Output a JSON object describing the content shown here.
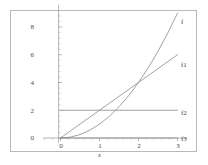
{
  "chart_data": {
    "type": "line",
    "title": "",
    "subtitle": "",
    "xlabel": "x",
    "ylabel": "",
    "xlim": [
      -0.45,
      3.25
    ],
    "ylim": [
      -0.35,
      9.6
    ],
    "grid": false,
    "legend_position": "right-inline-end-of-curve",
    "x_ticks": [
      "0",
      "1",
      "2",
      "3"
    ],
    "x_tick_values": [
      0,
      1,
      2,
      3
    ],
    "y_ticks": [
      "0",
      "2",
      "4",
      "6",
      "8"
    ],
    "y_tick_values": [
      0,
      2,
      4,
      6,
      8
    ],
    "series": [
      {
        "name": "f",
        "label": "f",
        "color": "#8a8a8a",
        "description": "quadratic curve rising steeply, y = x squared",
        "x": [
          0,
          0.25,
          0.5,
          0.75,
          1,
          1.25,
          1.5,
          1.75,
          2,
          2.25,
          2.5,
          2.75,
          3
        ],
        "values": [
          0,
          0.06,
          0.25,
          0.56,
          1,
          1.56,
          2.25,
          3.06,
          4,
          5.06,
          6.25,
          7.56,
          9
        ]
      },
      {
        "name": "f1",
        "label": "f1",
        "color": "#8a8a8a",
        "description": "straight line through the origin, y = 2x",
        "x": [
          0,
          3
        ],
        "values": [
          0,
          6
        ]
      },
      {
        "name": "f2",
        "label": "f2",
        "color": "#8a8a8a",
        "description": "constant horizontal line, y = 2",
        "x": [
          0,
          3
        ],
        "values": [
          2,
          2
        ]
      },
      {
        "name": "f3",
        "label": "f3",
        "color": "#8a8a8a",
        "description": "constant horizontal line along the axis, y = 0",
        "x": [
          0,
          3
        ],
        "values": [
          0,
          0
        ]
      }
    ],
    "annotations": [
      {
        "text": "f",
        "at_x": 3,
        "at_y": 9
      },
      {
        "text": "f1",
        "at_x": 3,
        "at_y": 6
      },
      {
        "text": "f2",
        "at_x": 3,
        "at_y": 2
      },
      {
        "text": "f3",
        "at_x": 3,
        "at_y": 0
      }
    ]
  },
  "figure": {
    "frame_color": "#b9b9b9",
    "axis_color": "#9a9a9a",
    "curve_color": "#8a8a8a",
    "text_color": "#4a4a4a",
    "background": "#ffffff"
  }
}
